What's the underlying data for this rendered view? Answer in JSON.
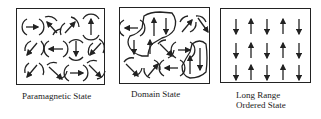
{
  "figure": {
    "panels": [
      {
        "id": "paramagnetic",
        "label_lines": [
          "Paramagnetic State"
        ],
        "arrangement": "random spin directions, each surrounded by curved field arcs"
      },
      {
        "id": "domain",
        "label_lines": [
          "Domain State"
        ],
        "arrangement": "spins grouped into domains outlined by closed curves"
      },
      {
        "id": "long-range",
        "label_lines": [
          "Long Range",
          "Ordered State"
        ],
        "arrangement": "5 columns x 3 rows of vertical arrows alternating down/up by column"
      }
    ],
    "long_range_columns": [
      "down",
      "up",
      "down",
      "up",
      "down"
    ],
    "colors": {
      "ink": "#222222",
      "background": "#ffffff"
    }
  }
}
